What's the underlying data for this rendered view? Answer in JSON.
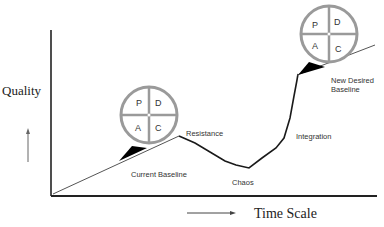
{
  "axes": {
    "y_label": "Quality",
    "x_label": "Time Scale"
  },
  "labels": {
    "current_baseline": "Current Baseline",
    "resistance": "Resistance",
    "chaos": "Chaos",
    "integration": "Integration",
    "new_desired_baseline_line1": "New Desired",
    "new_desired_baseline_line2": "Baseline"
  },
  "pdca_left": {
    "p": "P",
    "d": "D",
    "a": "A",
    "c": "C"
  },
  "pdca_right": {
    "p": "P",
    "d": "D",
    "a": "A",
    "c": "C"
  },
  "colors": {
    "wheel_stroke": "#9a9a9a",
    "line": "#1a1a1a",
    "wedge": "#000000"
  }
}
